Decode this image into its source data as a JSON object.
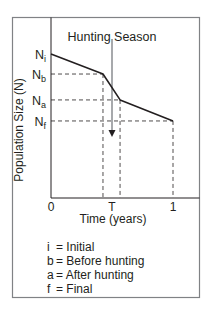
{
  "chart_data": {
    "type": "line",
    "title": "Hunting Season",
    "xlabel": "Time (years)",
    "ylabel": "Population Size (N)",
    "xlim": [
      0,
      1
    ],
    "ylim": [
      0,
      1
    ],
    "grid": false,
    "x_ticks": [
      {
        "value": 0,
        "label": "0"
      },
      {
        "value": 0.5,
        "label": "T"
      },
      {
        "value": 1,
        "label": "1"
      }
    ],
    "y_ticks": [
      {
        "key": "i",
        "value": 1.0,
        "label_main": "N",
        "label_sub": "i"
      },
      {
        "key": "b",
        "value": 0.861,
        "label_main": "N",
        "label_sub": "b"
      },
      {
        "key": "a",
        "value": 0.681,
        "label_main": "N",
        "label_sub": "a"
      },
      {
        "key": "f",
        "value": 0.535,
        "label_main": "N",
        "label_sub": "f"
      }
    ],
    "series": [
      {
        "name": "Population",
        "points": [
          {
            "x": 0,
            "y": 1.0,
            "label": "Ni"
          },
          {
            "x": 0.426,
            "y": 0.861,
            "label": "Nb"
          },
          {
            "x": 0.566,
            "y": 0.681,
            "label": "Na"
          },
          {
            "x": 1.0,
            "y": 0.535,
            "label": "Nf"
          }
        ]
      }
    ],
    "guides": [
      {
        "x": 0.426,
        "y": 0.861
      },
      {
        "x": 0.566,
        "y": 0.681
      },
      {
        "x": 1.0,
        "y": 0.535
      }
    ],
    "hunting_marker": {
      "x": 0.5,
      "y_top": 1.105,
      "arrow_tip_y": 0.424,
      "color": "#a7a9ac"
    },
    "legend": [
      {
        "key": "i",
        "text": "= Initial"
      },
      {
        "key": "b",
        "text": "= Before hunting"
      },
      {
        "key": "a",
        "text": "= After hunting"
      },
      {
        "key": "f",
        "text": "= Final"
      }
    ],
    "colors": {
      "line": "#231f20",
      "axis": "#231f20",
      "border": "#808285",
      "guide": "#231f20",
      "marker": "#a7a9ac"
    }
  }
}
